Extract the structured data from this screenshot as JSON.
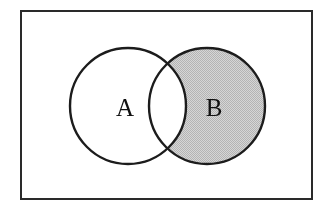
{
  "figure": {
    "canvas": {
      "width": 326,
      "height": 214
    },
    "background_color": "#ffffff"
  },
  "colors": {
    "frame_stroke": "#2a2a2a",
    "circle_stroke": "#1c1c1c",
    "circle_fill": "#c9c9c9",
    "intersection_fill": "#ffffff",
    "label_color": "#111111"
  },
  "universal_frame": {
    "name": "universal set rectangle",
    "x": 21,
    "y": 11,
    "width": 291,
    "height": 188,
    "stroke_width": 2,
    "fill": "#ffffff"
  },
  "circles": [
    {
      "id": "A",
      "label": "A",
      "cx": 128,
      "cy": 106,
      "r": 58,
      "stroke_width": 2.4,
      "shaded": true,
      "label_x": 125,
      "label_y": 107
    },
    {
      "id": "B",
      "label": "B",
      "cx": 207,
      "cy": 106,
      "r": 58,
      "stroke_width": 2.4,
      "shaded": true,
      "label_x": 214,
      "label_y": 107
    }
  ],
  "intersection": {
    "name": "A intersect B",
    "shaded": false,
    "fill": "#ffffff",
    "center_x": 167,
    "center_y": 106,
    "top_crossing_y": 66,
    "bottom_crossing_y": 146,
    "half_width": 21
  },
  "labels": {
    "set_a": "A",
    "set_b": "B"
  }
}
